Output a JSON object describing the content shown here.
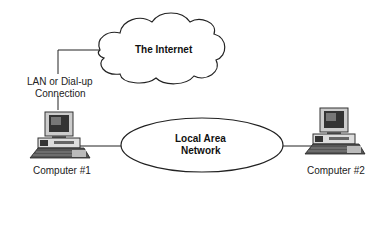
{
  "diagram": {
    "internet": {
      "label": "The Internet"
    },
    "connection": {
      "label_line1": "LAN or Dial-up",
      "label_line2": "Connection"
    },
    "lan": {
      "label_line1": "Local Area",
      "label_line2": "Network"
    },
    "computers": [
      {
        "label": "Computer #1"
      },
      {
        "label": "Computer #2"
      }
    ]
  }
}
